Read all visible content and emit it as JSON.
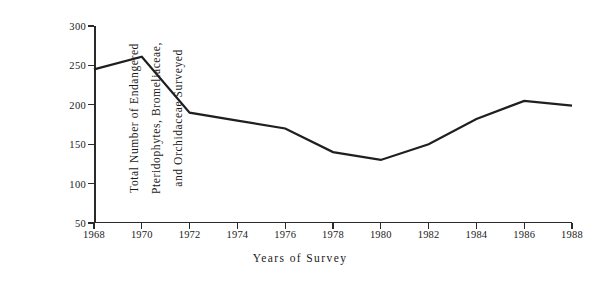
{
  "chart_data": {
    "type": "line",
    "title": "",
    "xlabel": "Years of Survey",
    "ylabel": "Total Number of Endangered Pteridophytes, Bromeliaceae, and Orchidaceae Surveyed",
    "ylabel_lines": [
      "Total Number of Endangered",
      "Pteridophytes, Bromeliaceae,",
      "and Orchidaceae Surveyed"
    ],
    "x": [
      1968,
      1970,
      1972,
      1974,
      1976,
      1978,
      1980,
      1982,
      1984,
      1986,
      1988
    ],
    "values": [
      245,
      261,
      190,
      180,
      170,
      140,
      130,
      150,
      182,
      205,
      199
    ],
    "categories": [
      "1968",
      "1970",
      "1972",
      "1974",
      "1976",
      "1978",
      "1980",
      "1982",
      "1984",
      "1986",
      "1988"
    ],
    "xtick_labels": [
      "1968",
      "1970",
      "1972",
      "1974",
      "1976",
      "1978",
      "1980",
      "1982",
      "1984",
      "1986",
      "1988"
    ],
    "ytick_labels": [
      "300",
      "250",
      "200",
      "150",
      "100",
      "50"
    ],
    "ytick_values": [
      300,
      250,
      200,
      150,
      100,
      50
    ],
    "ylim": [
      50,
      300
    ],
    "xlim": [
      1968,
      1988
    ],
    "grid": false,
    "legend": false,
    "legend_position": "none",
    "line_color": "#1f1f1f",
    "axis_color": "#2a2a2a",
    "background_color": "#ffffff"
  }
}
